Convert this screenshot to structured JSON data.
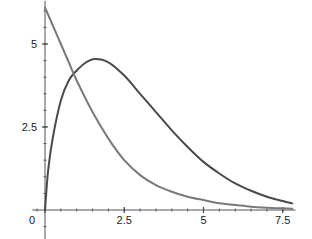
{
  "chart_data": {
    "type": "line",
    "title": "",
    "xlabel": "",
    "ylabel": "",
    "xlim": [
      -0.4,
      7.9
    ],
    "ylim": [
      -0.9,
      6.3
    ],
    "x_ticks": [
      {
        "value": 0,
        "label": "0"
      },
      {
        "value": 2.5,
        "label": "2.5"
      },
      {
        "value": 5,
        "label": "5"
      },
      {
        "value": 7.5,
        "label": "7.5"
      }
    ],
    "y_ticks": [
      {
        "value": 2.5,
        "label": "2.5"
      },
      {
        "value": 5,
        "label": "5"
      }
    ],
    "minor_tick_step": 0.5,
    "grid": false,
    "legend": null,
    "series": [
      {
        "name": "rising-peaked curve",
        "color": "#4a4a4a",
        "x": [
          0,
          0.1,
          0.25,
          0.5,
          0.75,
          1,
          1.3,
          1.58,
          2,
          2.5,
          3,
          3.5,
          4,
          4.5,
          5,
          5.5,
          6,
          6.5,
          7,
          7.5,
          7.8
        ],
        "y": [
          0,
          1.2,
          2.2,
          3.3,
          3.9,
          4.2,
          4.45,
          4.55,
          4.45,
          4.05,
          3.5,
          2.95,
          2.4,
          1.9,
          1.45,
          1.1,
          0.8,
          0.58,
          0.4,
          0.27,
          0.2
        ]
      },
      {
        "name": "decaying curve",
        "color": "#7a7a7a",
        "x": [
          0,
          0.25,
          0.5,
          0.75,
          1,
          1.5,
          2,
          2.5,
          3,
          3.5,
          4,
          4.5,
          5,
          5.5,
          6,
          6.5,
          7,
          7.5,
          7.8
        ],
        "y": [
          6.1,
          5.55,
          5.0,
          4.45,
          3.9,
          2.95,
          2.15,
          1.5,
          1.05,
          0.75,
          0.55,
          0.4,
          0.3,
          0.2,
          0.15,
          0.1,
          0.07,
          0.05,
          0.04
        ]
      }
    ]
  }
}
